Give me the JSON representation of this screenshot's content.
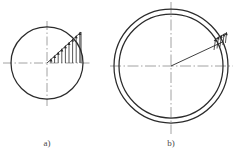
{
  "figure": {
    "type": "engineering-diagram",
    "background_color": "#ffffff",
    "line_color": "#2b2b2b",
    "centerline_color": "#8c8c8c",
    "caption_color": "#4a4a4a",
    "subfigures": [
      {
        "id": "a",
        "caption": "a)",
        "caption_x": 47,
        "caption_y": 146,
        "center_x": 47,
        "center_y": 63,
        "circles": [
          {
            "name": "solid-circle",
            "radius": 36
          }
        ],
        "centerlines": {
          "horizontal": {
            "x1": 3,
            "x2": 92,
            "y": 63
          },
          "vertical": {
            "y1": 21,
            "y2": 106,
            "x": 47
          }
        },
        "radius_line": {
          "name": "inclined-distribution-baseline",
          "angle_deg": -42,
          "length": 46
        },
        "load_distribution": {
          "name": "triangular-arrow-distribution",
          "arrow_count": 10,
          "shape": "triangular",
          "direction": "up-left",
          "max_arrow_length": 17,
          "min_arrow_length": 2
        }
      },
      {
        "id": "b",
        "caption": "b)",
        "caption_x": 171,
        "caption_y": 146,
        "center_x": 171,
        "center_y": 66,
        "circles": [
          {
            "name": "outer-circle",
            "radius": 57
          },
          {
            "name": "inner-circle",
            "radius": 52
          }
        ],
        "centerlines": {
          "horizontal": {
            "x1": 110,
            "x2": 233,
            "y": 66
          },
          "vertical": {
            "y1": 2,
            "y2": 134,
            "x": 171
          }
        },
        "radius_line": {
          "name": "radius-line-to-load",
          "angle_deg": -25,
          "length": 57
        },
        "load_distribution": {
          "name": "concentrated-arrow-cluster",
          "arrow_count": 5,
          "shape": "narrow-cluster",
          "direction": "up-left",
          "max_arrow_length": 13,
          "min_arrow_length": 3
        }
      }
    ]
  }
}
